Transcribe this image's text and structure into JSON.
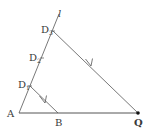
{
  "diagram": {
    "type": "geometry-construction",
    "colors": {
      "line": "#555555",
      "text": "#3a3a3a",
      "point": "#111111"
    },
    "points": {
      "A": {
        "label": "A",
        "x": 19,
        "y": 113
      },
      "B": {
        "label": "B",
        "x": 58,
        "y": 113
      },
      "Q": {
        "label": "Q",
        "x": 138,
        "y": 113
      },
      "D1": {
        "label": "D",
        "sub": "1",
        "x": 30,
        "y": 86
      },
      "D2": {
        "label": "D",
        "sub": "2",
        "x": 42,
        "y": 58
      },
      "D3": {
        "label": "D",
        "sub": "3",
        "x": 53,
        "y": 31
      }
    },
    "ray": {
      "label": "l",
      "from": "A",
      "through": "D3"
    },
    "segments": [
      {
        "from": "A",
        "to": "Q",
        "name": "base-AQ"
      },
      {
        "from": "D3",
        "to": "Q",
        "name": "segment-D3Q",
        "arrow": true
      },
      {
        "from": "D1",
        "to": "B",
        "name": "segment-D1B",
        "arrow": true
      }
    ]
  }
}
